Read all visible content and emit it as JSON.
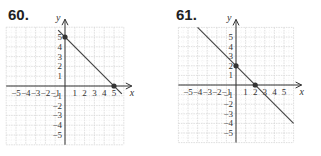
{
  "chart_data": [
    {
      "type": "line",
      "label": "60.",
      "title": "",
      "xlabel": "x",
      "ylabel": "y",
      "xlim": [
        -6,
        6
      ],
      "ylim": [
        -6,
        6
      ],
      "x_ticks": [
        -5,
        -4,
        -3,
        -2,
        -1,
        1,
        2,
        3,
        4,
        5
      ],
      "y_ticks": [
        5,
        4,
        3,
        2,
        1,
        -1,
        -2,
        -3,
        -4,
        -5
      ],
      "grid": true,
      "line": {
        "x1": -0.7,
        "y1": 5.7,
        "x2": 5.8,
        "y2": -0.8
      },
      "points": [
        {
          "x": 0,
          "y": 5
        },
        {
          "x": 5,
          "y": 0
        }
      ]
    },
    {
      "type": "line",
      "label": "61.",
      "title": "",
      "xlabel": "x",
      "ylabel": "y",
      "xlim": [
        -6,
        6
      ],
      "ylim": [
        -6,
        6
      ],
      "x_ticks": [
        -5,
        -4,
        -3,
        -2,
        -1,
        1,
        2,
        3,
        4,
        5
      ],
      "y_ticks": [
        5,
        4,
        3,
        2,
        1,
        -1,
        -2,
        -3,
        -4,
        -5
      ],
      "grid": true,
      "line": {
        "x1": -4,
        "y1": 6,
        "x2": 6,
        "y2": -4
      },
      "points": [
        {
          "x": 0,
          "y": 2
        },
        {
          "x": 2,
          "y": 0
        }
      ]
    }
  ]
}
